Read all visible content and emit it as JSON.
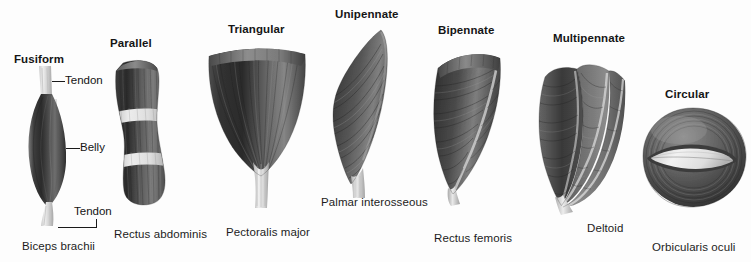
{
  "figure": {
    "background_color": "#fdfdfd",
    "ink_color": "#1a1a1a"
  },
  "muscle_types": [
    {
      "id": "fusiform",
      "title": "Fusiform",
      "example": "Biceps brachii",
      "illustration": "fusiform-muscle-illustration"
    },
    {
      "id": "parallel",
      "title": "Parallel",
      "example": "Rectus abdominis",
      "illustration": "parallel-muscle-illustration"
    },
    {
      "id": "triangular",
      "title": "Triangular",
      "example": "Pectoralis major",
      "illustration": "triangular-muscle-illustration"
    },
    {
      "id": "unipennate",
      "title": "Unipennate",
      "example": "Palmar interosseous",
      "illustration": "unipennate-muscle-illustration"
    },
    {
      "id": "bipennate",
      "title": "Bipennate",
      "example": "Rectus femoris",
      "illustration": "bipennate-muscle-illustration"
    },
    {
      "id": "multipennate",
      "title": "Multipennate",
      "example": "Deltoid",
      "illustration": "multipennate-muscle-illustration"
    },
    {
      "id": "circular",
      "title": "Circular",
      "example": "Orbicularis oculi",
      "illustration": "circular-muscle-illustration"
    }
  ],
  "annotations": {
    "tendon_upper": "Tendon",
    "belly": "Belly",
    "tendon_lower": "Tendon"
  }
}
